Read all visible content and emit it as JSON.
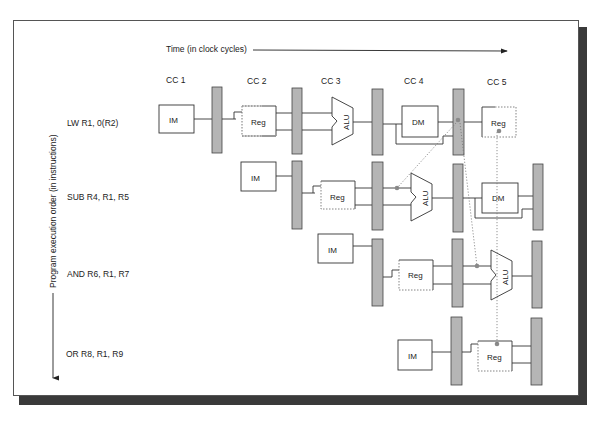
{
  "diagram": {
    "time_label": "Time (in clock cycles)",
    "order_label": "Program execution order (in instructions)",
    "clock_cycles": [
      "CC 1",
      "CC 2",
      "CC 3",
      "CC 4",
      "CC 5"
    ],
    "instructions": [
      {
        "label": "LW R1, 0(R2)",
        "stages": [
          "IM",
          "Reg",
          "ALU",
          "DM",
          "Reg"
        ]
      },
      {
        "label": "SUB R4, R1, R5",
        "stages": [
          "IM",
          "Reg",
          "ALU",
          "DM"
        ]
      },
      {
        "label": "AND R6, R1, R7",
        "stages": [
          "IM",
          "Reg",
          "ALU"
        ]
      },
      {
        "label": "OR R8, R1, R9",
        "stages": [
          "IM",
          "Reg"
        ]
      }
    ],
    "stage_labels": {
      "im": "IM",
      "reg": "Reg",
      "alu": "ALU",
      "dm": "DM"
    },
    "colors": {
      "pipeline_register": "#b5b5b5",
      "forwarding_dot": "#8a8a8a",
      "line": "#333333",
      "shadow": "#3a3a3a"
    }
  }
}
